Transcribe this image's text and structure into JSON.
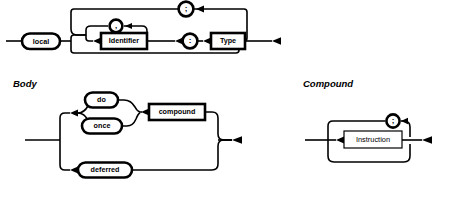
{
  "page": {
    "background": "#ffffff",
    "ink": "#000000"
  },
  "diagrams": [
    {
      "id": "local-declaration",
      "section_label": "",
      "nodes": {
        "keyword_local": "local",
        "identifier": "Identifier",
        "type": "Type",
        "comma": ",",
        "colon": ":",
        "semicolon": ";"
      }
    },
    {
      "id": "body",
      "section_label": "Body",
      "nodes": {
        "do": "do",
        "once": "once",
        "compound": "compound",
        "deferred": "deferred"
      }
    },
    {
      "id": "compound",
      "section_label": "Compound",
      "nodes": {
        "instruction": "Instruction",
        "semicolon": ";"
      }
    }
  ]
}
